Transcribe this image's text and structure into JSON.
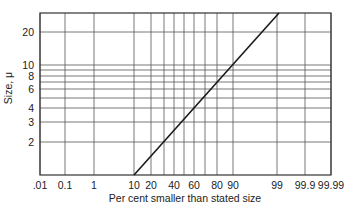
{
  "chart_data": {
    "type": "line",
    "title": "",
    "xlabel": "Per cent smaller than stated size",
    "ylabel": "Size, μ",
    "x_scale": "probability",
    "y_scale": "log",
    "xlim": [
      0.01,
      99.99
    ],
    "ylim": [
      1,
      30
    ],
    "grid": true,
    "x_ticks": [
      {
        "label": ".01",
        "value": 0.01,
        "px": 40
      },
      {
        "label": "0.1",
        "value": 0.1,
        "px": 65
      },
      {
        "label": "1",
        "value": 1,
        "px": 94
      },
      {
        "label": "10",
        "value": 10,
        "px": 134
      },
      {
        "label": "20",
        "value": 20,
        "px": 151
      },
      {
        "label": "",
        "value": 30,
        "px": 164
      },
      {
        "label": "40",
        "value": 40,
        "px": 174
      },
      {
        "label": "",
        "value": 50,
        "px": 184
      },
      {
        "label": "60",
        "value": 60,
        "px": 194
      },
      {
        "label": "",
        "value": 70,
        "px": 205
      },
      {
        "label": "80",
        "value": 80,
        "px": 217
      },
      {
        "label": "90",
        "value": 90,
        "px": 233
      },
      {
        "label": "99",
        "value": 99,
        "px": 277
      },
      {
        "label": "99.9",
        "value": 99.9,
        "px": 305
      },
      {
        "label": "99.99",
        "value": 99.99,
        "px": 331
      }
    ],
    "y_ticks": [
      {
        "label": "20",
        "value": 20,
        "py": 32
      },
      {
        "label": "10",
        "value": 10,
        "py": 65
      },
      {
        "label": "",
        "value": 9,
        "py": 70
      },
      {
        "label": "8",
        "value": 8,
        "py": 76
      },
      {
        "label": "",
        "value": 7,
        "py": 82
      },
      {
        "label": "6",
        "value": 6,
        "py": 89
      },
      {
        "label": "",
        "value": 5,
        "py": 98
      },
      {
        "label": "4",
        "value": 4,
        "py": 108
      },
      {
        "label": "3",
        "value": 3,
        "py": 122
      },
      {
        "label": "2",
        "value": 2,
        "py": 142
      }
    ],
    "series": [
      {
        "name": "Size distribution (log-normal)",
        "x": [
          10,
          50,
          90,
          99
        ],
        "y": [
          1,
          3.2,
          10,
          30
        ],
        "px": [
          [
            134,
            175
          ],
          [
            279,
            13
          ]
        ]
      }
    ],
    "legend": null
  },
  "plot_area": {
    "left": 40,
    "top": 13,
    "right": 331,
    "bottom": 175
  },
  "colors": {
    "grid": "#555555",
    "line": "#1a1a1a",
    "axis": "#333333"
  }
}
